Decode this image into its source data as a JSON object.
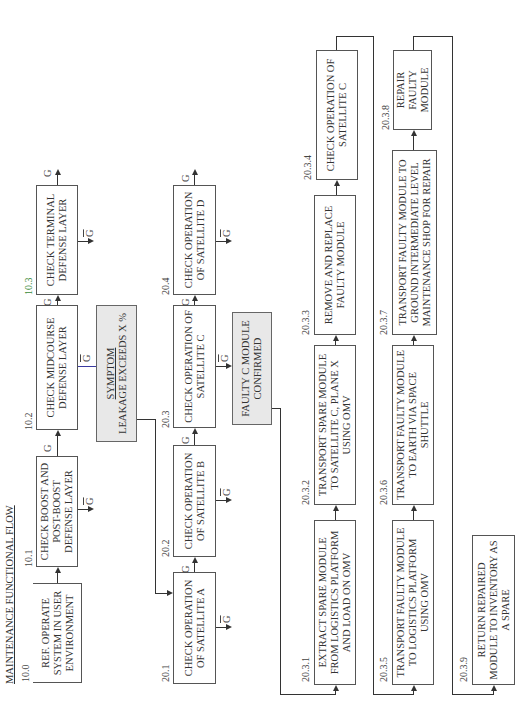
{
  "title": "MAINTENANCE FUNCTIONAL FLOW",
  "labels": {
    "go": "G",
    "nogo": "G"
  },
  "colors": {
    "line": "#333333",
    "box_border": "#555555",
    "shade": "#e8e8e8",
    "accent_blue": "#3a3aa0",
    "accent_green": "#3a8a3a"
  },
  "nodes": [
    {
      "id": "10.0",
      "text": "REF. OPERATE SYSTEM IN USER ENVIRONMENT"
    },
    {
      "id": "10.1",
      "text": "CHECK BOOST AND POST-BOOST DEFENSE LAYER"
    },
    {
      "id": "10.2",
      "text": "CHECK MIDCOURSE DEFENSE LAYER"
    },
    {
      "id": "10.3",
      "text": "CHECK TERMINAL DEFENSE LAYER"
    },
    {
      "id": "symptom",
      "heading": "SYMPTOM",
      "text": "LEAKAGE EXCEEDS X %"
    },
    {
      "id": "20.1",
      "text": "CHECK OPERATION OF SATELLITE A"
    },
    {
      "id": "20.2",
      "text": "CHECK OPERATION OF SATELLITE B"
    },
    {
      "id": "20.3",
      "text": "CHECK OPERATION OF SATELLITE C"
    },
    {
      "id": "20.4",
      "text": "CHECK OPERATION OF SATELLITE D"
    },
    {
      "id": "faulty",
      "text": "FAULTY C MODULE CONFIRMED"
    },
    {
      "id": "20.3.1",
      "text": "EXTRACT SPARE MODULE FROM LOGISTICS PLATFORM AND LOAD ON OMV"
    },
    {
      "id": "20.3.2",
      "text": "TRANSPORT SPARE MODULE TO SATELLITE C, PLANE X USING OMV"
    },
    {
      "id": "20.3.3",
      "text": "REMOVE AND REPLACE FAULTY MODULE"
    },
    {
      "id": "20.3.4",
      "text": "CHECK OPERATION OF SATELLITE C"
    },
    {
      "id": "20.3.5",
      "text": "TRANSPORT FAULTY MODULE TO LOGISTICS PLATFORM USING OMV"
    },
    {
      "id": "20.3.6",
      "text": "TRANSPORT FAULTY MODULE TO EARTH VIA SPACE SHUTTLE"
    },
    {
      "id": "20.3.7",
      "text": "TRANSPORT FAULTY MODULE TO GROUND INTERMEDIATE LEVEL MAINTENANCE SHOP FOR REPAIR"
    },
    {
      "id": "20.3.8",
      "text": "REPAIR FAULTY MODULE"
    },
    {
      "id": "20.3.9",
      "text": "RETURN REPAIRED MODULE TO INVENTORY AS A SPARE"
    }
  ]
}
